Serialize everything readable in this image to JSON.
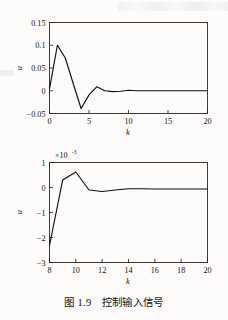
{
  "page": {
    "background_color": "#fdfcfb",
    "ink_color": "#0f0d0b"
  },
  "caption": {
    "text": "图 1.9　控制输入信号",
    "figure_number": "1.9",
    "title": "控制输入信号"
  },
  "chart_data": [
    {
      "id": "top",
      "type": "line",
      "title": "",
      "xlabel": "k",
      "ylabel": "u",
      "xlim": [
        0,
        20
      ],
      "ylim": [
        -0.05,
        0.15
      ],
      "xticks": [
        0,
        5,
        10,
        15,
        20
      ],
      "xtick_labels": [
        "0",
        "5",
        "10",
        "15",
        "20"
      ],
      "yticks": [
        -0.05,
        0,
        0.05,
        0.1,
        0.15
      ],
      "ytick_labels": [
        "-0.05",
        "0",
        "0.05",
        "0.1",
        "0.15"
      ],
      "grid": false,
      "legend": "none",
      "multiplier": "",
      "series": [
        {
          "name": "u(k)",
          "color": "#0f0d0b",
          "x": [
            0,
            1,
            2,
            3,
            4,
            5,
            6,
            7,
            8,
            9,
            10,
            11,
            12,
            13,
            14,
            15,
            16,
            17,
            18,
            19,
            20
          ],
          "y": [
            0.004,
            0.1,
            0.072,
            0.016,
            -0.039,
            -0.009,
            0.009,
            0.0,
            -0.002,
            -0.001,
            0.001,
            0.0,
            0.0,
            0.0,
            0.0,
            0.0,
            0.0,
            0.0,
            0.0,
            0.0,
            0.0
          ]
        }
      ]
    },
    {
      "id": "bottom",
      "type": "line",
      "title": "",
      "xlabel": "k",
      "ylabel": "u",
      "xlim": [
        8,
        20
      ],
      "ylim": [
        -3,
        1
      ],
      "xticks": [
        8,
        10,
        12,
        14,
        16,
        18,
        20
      ],
      "xtick_labels": [
        "8",
        "10",
        "12",
        "14",
        "16",
        "18",
        "20"
      ],
      "yticks": [
        -3,
        -2,
        -1,
        0,
        1
      ],
      "ytick_labels": [
        "-3",
        "-2",
        "-1",
        "0",
        "1"
      ],
      "grid": false,
      "legend": "none",
      "multiplier": "×10",
      "multiplier_exponent": "-3",
      "units_note": "y values are in units of 1e-3",
      "series": [
        {
          "name": "u(k)",
          "color": "#0f0d0b",
          "x": [
            8,
            9,
            10,
            11,
            12,
            13,
            14,
            15,
            16,
            17,
            18,
            19,
            20
          ],
          "y": [
            -2.32,
            0.3,
            0.62,
            -0.1,
            -0.16,
            -0.1,
            -0.05,
            -0.05,
            -0.06,
            -0.06,
            -0.06,
            -0.06,
            -0.06
          ]
        }
      ]
    }
  ]
}
